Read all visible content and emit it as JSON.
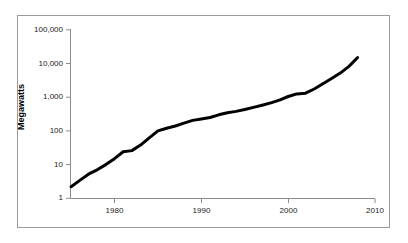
{
  "chart_data": {
    "type": "line",
    "title": "",
    "subtitle": "",
    "xlabel": "",
    "ylabel": "Megawatts",
    "yscale": "log",
    "xscale": "linear",
    "xlim": [
      1974,
      2010
    ],
    "ylim": [
      1,
      100000
    ],
    "grid": false,
    "legend": null,
    "legend_position": "none",
    "x_tick_labels": [
      "1980",
      "1990",
      "2000",
      "2010"
    ],
    "x_ticks": [
      1980,
      1990,
      2000,
      2010
    ],
    "y_tick_labels": [
      "1",
      "10",
      "100",
      "1,000",
      "10,000",
      "100,000"
    ],
    "y_ticks": [
      1,
      10,
      100,
      1000,
      10000,
      100000
    ],
    "line_color": "#000000",
    "line_width": 3,
    "series": [
      {
        "name": "Megawatts",
        "x": [
          1975,
          1976,
          1977,
          1978,
          1979,
          1980,
          1981,
          1982,
          1983,
          1984,
          1985,
          1986,
          1987,
          1988,
          1989,
          1990,
          1991,
          1992,
          1993,
          1994,
          1995,
          1996,
          1997,
          1998,
          1999,
          2000,
          2001,
          2002,
          2003,
          2004,
          2005,
          2006,
          2007,
          2008
        ],
        "values": [
          2.2,
          3.4,
          5.2,
          7.0,
          10.0,
          15.0,
          24.0,
          26.0,
          38.0,
          62.0,
          100.0,
          120.0,
          140.0,
          170.0,
          205.0,
          225.0,
          250.0,
          300.0,
          345.0,
          380.0,
          430.0,
          500.0,
          580.0,
          680.0,
          820.0,
          1050.0,
          1250.0,
          1320.0,
          1750.0,
          2500.0,
          3600.0,
          5200.0,
          8200.0,
          15000.0
        ]
      }
    ]
  },
  "axes": {
    "y_title": "Megawatts",
    "y_labels": {
      "l100000": "100,000",
      "l10000": "10,000",
      "l1000": "1,000",
      "l100": "100",
      "l10": "10",
      "l1": "1"
    },
    "x_labels": {
      "x1980": "1980",
      "x1990": "1990",
      "x2000": "2000",
      "x2010": "2010"
    }
  },
  "style": {
    "axis_color": "#8c8c8c",
    "frame_color": "#9a9a9a",
    "line_color": "#000000",
    "text_color": "#1a1a1a",
    "background": "#ffffff"
  }
}
